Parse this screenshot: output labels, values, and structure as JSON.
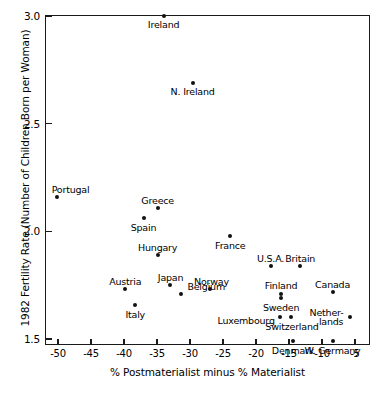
{
  "chart_data": {
    "type": "scatter",
    "title": "",
    "xlabel": "% Postmaterialist minus % Materialist",
    "ylabel": "1982 Fertility Rate (Number of Children Born per Woman)",
    "xlim": [
      -52,
      -4
    ],
    "ylim": [
      1.43,
      3.03
    ],
    "xticks": [
      -50,
      -45,
      -40,
      -35,
      -30,
      -25,
      -20,
      -15,
      -10,
      -5
    ],
    "xticklabels": [
      "-50",
      "-45",
      "-40",
      "-35",
      "-30",
      "-25",
      "-20",
      "-15",
      "-10",
      "-5"
    ],
    "yticks": [
      1.5,
      2.0,
      2.5,
      3.0
    ],
    "yticklabels": [
      "1.5",
      "2.0",
      "2.5",
      "3.0"
    ],
    "grid": false,
    "legend": null,
    "points": [
      {
        "label": "Ireland",
        "x": -34.0,
        "y": 3.0,
        "lx": 0,
        "ly": 9,
        "align": "c"
      },
      {
        "label": "N. Ireland",
        "x": -29.6,
        "y": 2.69,
        "lx": 0,
        "ly": 9,
        "align": "c"
      },
      {
        "label": "Portugal",
        "x": -50.2,
        "y": 2.16,
        "lx": -5,
        "ly": -7,
        "align": "l"
      },
      {
        "label": "Greece",
        "x": -34.9,
        "y": 2.11,
        "lx": 0,
        "ly": -7,
        "align": "c"
      },
      {
        "label": "Spain",
        "x": -36.9,
        "y": 2.06,
        "lx": -1,
        "ly": 10,
        "align": "c"
      },
      {
        "label": "Hungary",
        "x": -34.9,
        "y": 1.89,
        "lx": 0,
        "ly": -7,
        "align": "c"
      },
      {
        "label": "France",
        "x": -23.9,
        "y": 1.98,
        "lx": 0,
        "ly": 10,
        "align": "c"
      },
      {
        "label": "U.S.A.",
        "x": -17.8,
        "y": 1.84,
        "lx": 0,
        "ly": -7,
        "align": "c"
      },
      {
        "label": "Britain",
        "x": -13.3,
        "y": 1.84,
        "lx": 0,
        "ly": -7,
        "align": "c"
      },
      {
        "label": "Austria",
        "x": -39.8,
        "y": 1.73,
        "lx": 0,
        "ly": -7,
        "align": "c"
      },
      {
        "label": "Japan",
        "x": -33.1,
        "y": 1.75,
        "lx": 1,
        "ly": -7,
        "align": "c"
      },
      {
        "label": "Belgium",
        "x": -31.3,
        "y": 1.71,
        "lx": 6,
        "ly": -7,
        "align": "l"
      },
      {
        "label": "Norway",
        "x": -26.9,
        "y": 1.73,
        "lx": 1,
        "ly": -7,
        "align": "c"
      },
      {
        "label": "Italy",
        "x": -38.3,
        "y": 1.66,
        "lx": 0,
        "ly": 10,
        "align": "c"
      },
      {
        "label": "Finland",
        "x": -16.2,
        "y": 1.71,
        "lx": 0,
        "ly": -8,
        "align": "c"
      },
      {
        "label": "Sweden",
        "x": -16.2,
        "y": 1.69,
        "lx": 0,
        "ly": 10,
        "align": "c"
      },
      {
        "label": "Canada",
        "x": -8.4,
        "y": 1.72,
        "lx": 0,
        "ly": -7,
        "align": "c"
      },
      {
        "label": "Luxembourg",
        "x": -16.4,
        "y": 1.6,
        "lx": -5,
        "ly": 4,
        "align": "r"
      },
      {
        "label": "Switzerland",
        "x": -14.7,
        "y": 1.6,
        "lx": 1,
        "ly": 10,
        "align": "c"
      },
      {
        "label": "Nether-",
        "x": -5.7,
        "y": 1.6,
        "lx": -7,
        "ly": -4,
        "align": "r"
      },
      {
        "label": "lands",
        "x": -5.7,
        "y": 1.6,
        "lx": -7,
        "ly": 5,
        "align": "r"
      },
      {
        "label": "Denmark",
        "x": -14.4,
        "y": 1.49,
        "lx": 0,
        "ly": 10,
        "align": "c"
      },
      {
        "label": "W. Germany",
        "x": -8.4,
        "y": 1.49,
        "lx": 0,
        "ly": 10,
        "align": "c"
      }
    ]
  }
}
